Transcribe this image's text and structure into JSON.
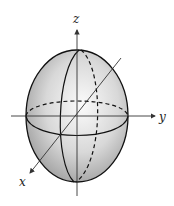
{
  "figure": {
    "type": "ellipsoid",
    "colors": {
      "surface_light": "#f2f2f2",
      "surface_dark": "#9a9a9a",
      "outline": "#111111",
      "axis": "#333333"
    },
    "axes": {
      "x": {
        "label": "x"
      },
      "y": {
        "label": "y"
      },
      "z": {
        "label": "z"
      }
    }
  }
}
